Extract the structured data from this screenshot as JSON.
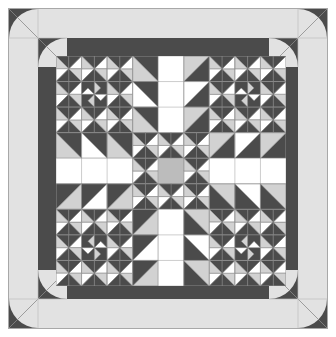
{
  "artwork": {
    "title": "Quilt Block Layout Preview",
    "type": "quilt-pattern-diagram",
    "canvas": {
      "width": 336,
      "height": 337
    },
    "palette": {
      "background": "#ffffff",
      "outer_frame_line": "#b4b4b4",
      "light_border": "#e2e2e2",
      "dark_border": "#4b4b4b",
      "fabric_dark": "#4b4b4b",
      "fabric_white": "#ffffff",
      "fabric_light_gray": "#d2d2d2",
      "fabric_mid_gray": "#bcbcbc",
      "seam_line": "#808080"
    },
    "layout": {
      "outer_margin_px": 8,
      "light_border_width_px": 30,
      "dark_border_width_px": 18,
      "inner_field": {
        "x": 56,
        "y": 56,
        "width": 230,
        "height": 230
      },
      "grid_rows": 9,
      "grid_cols": 9,
      "cell_px": 25.6
    },
    "corner_blocks": {
      "count": 4,
      "motif": "drunkards-path-quarter-circle",
      "names": [
        "corner-top-left",
        "corner-top-right",
        "corner-bottom-left",
        "corner-bottom-right"
      ]
    },
    "center_patch": {
      "motif": "solid-square",
      "color": "#bcbcbc",
      "row": 4,
      "col": 4
    },
    "block_grid": [
      [
        "S",
        "S",
        "S",
        "K",
        "W",
        "K",
        "S",
        "S",
        "S"
      ],
      [
        "S",
        "P",
        "S",
        "K",
        "W",
        "K",
        "S",
        "P",
        "S"
      ],
      [
        "S",
        "S",
        "S",
        "K",
        "W",
        "K",
        "S",
        "S",
        "S"
      ],
      [
        "K",
        "K",
        "K",
        "S",
        "S",
        "S",
        "K",
        "K",
        "K"
      ],
      [
        "W",
        "W",
        "W",
        "S",
        "C",
        "S",
        "W",
        "W",
        "W"
      ],
      [
        "K",
        "K",
        "K",
        "S",
        "S",
        "S",
        "K",
        "K",
        "K"
      ],
      [
        "S",
        "S",
        "S",
        "K",
        "W",
        "K",
        "S",
        "S",
        "S"
      ],
      [
        "S",
        "P",
        "S",
        "K",
        "W",
        "K",
        "S",
        "P",
        "S"
      ],
      [
        "S",
        "S",
        "S",
        "K",
        "W",
        "K",
        "S",
        "S",
        "S"
      ]
    ],
    "legend": {
      "S": "star-point-unit",
      "P": "pinwheel-center-unit",
      "K": "kite-unit",
      "W": "white-background-unit",
      "C": "center-square-unit"
    }
  }
}
